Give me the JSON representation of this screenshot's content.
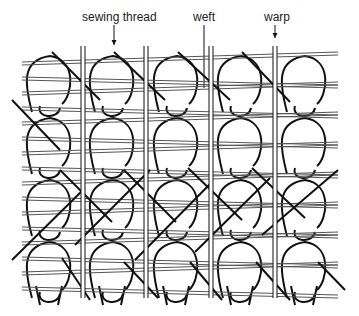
{
  "diagram": {
    "labels": [
      {
        "id": "sewing-thread",
        "text": "sewing thread",
        "x": 82,
        "y": 10,
        "arrow_x": 114,
        "arrow_y1": 25,
        "arrow_y2": 45,
        "arrow_head": true
      },
      {
        "id": "weft",
        "text": "weft",
        "x": 193,
        "y": 10,
        "arrow_x": 204,
        "arrow_y1": 25,
        "arrow_y2": 88,
        "arrow_head": false
      },
      {
        "id": "warp",
        "text": "warp",
        "x": 264,
        "y": 10,
        "arrow_x": 275,
        "arrow_y1": 25,
        "arrow_y2": 38,
        "arrow_head": true
      }
    ],
    "warp_x": [
      83,
      146,
      211,
      275
    ],
    "warp_top": 46,
    "warp_bottom": 298,
    "column_x": [
      50,
      113,
      177,
      241,
      305
    ],
    "loop_rows_y": [
      50,
      112,
      174,
      236
    ],
    "stroke_color": "#111111",
    "weft_color": "#555555"
  }
}
